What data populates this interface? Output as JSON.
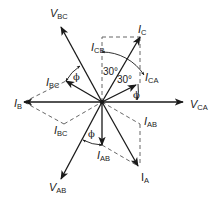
{
  "diagram": {
    "type": "phasor-diagram",
    "colors": {
      "line": "#1a1a1a",
      "dashed": "#555555",
      "background": "#ffffff"
    },
    "center": [
      102,
      102
    ],
    "voltage_phasors": [
      {
        "name": "V",
        "sub": "CA",
        "tip": [
          183,
          102
        ]
      },
      {
        "name": "V",
        "sub": "BC",
        "tip": [
          61,
          27
        ]
      },
      {
        "name": "V",
        "sub": "AB",
        "tip": [
          61,
          179
        ]
      }
    ],
    "line_currents": [
      {
        "name": "I",
        "sub": "A",
        "tip": [
          138,
          166
        ]
      },
      {
        "name": "I",
        "sub": "B",
        "tip": [
          24,
          102
        ]
      },
      {
        "name": "I",
        "sub": "C",
        "tip": [
          140,
          37
        ]
      }
    ],
    "phase_currents": [
      {
        "name": "I",
        "sub": "CA",
        "tip": [
          136,
          85
        ]
      },
      {
        "name": "I",
        "sub": "BC",
        "tip": [
          66,
          81
        ]
      },
      {
        "name": "I",
        "sub": "AB",
        "tip": [
          102,
          145
        ]
      }
    ],
    "labels": {
      "V_BC": {
        "main": "V",
        "sub": "BC"
      },
      "V_CA": {
        "main": "V",
        "sub": "CA"
      },
      "V_AB": {
        "main": "V",
        "sub": "AB"
      },
      "I_C": {
        "main": "I",
        "sub": "C"
      },
      "I_CB": {
        "main": "I",
        "sub": "CB"
      },
      "I_CA": {
        "main": "I",
        "sub": "CA"
      },
      "I_BC_top": {
        "main": "I",
        "sub": "BC"
      },
      "I_BC_bottom": {
        "main": "I",
        "sub": "BC"
      },
      "I_B": {
        "main": "I",
        "sub": "B"
      },
      "I_AB_right": {
        "main": "I",
        "sub": "AB"
      },
      "I_AB_bottom": {
        "main": "I",
        "sub": "AB"
      },
      "I_A": {
        "main": "I",
        "sub": "A"
      }
    },
    "angles": {
      "a1": "30°",
      "a2": "30°",
      "phi": "ϕ"
    }
  }
}
